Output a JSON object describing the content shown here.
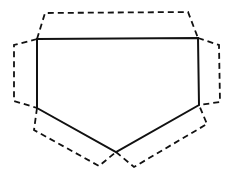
{
  "diagram": {
    "colors": {
      "background": "#ffffff",
      "stroke": "#111111"
    },
    "base_shape": {
      "name": "pentagon",
      "line_style": "solid",
      "sides": 5
    },
    "flaps": [
      {
        "id": "top",
        "line_style": "dashed",
        "attached_side": "top"
      },
      {
        "id": "left",
        "line_style": "dashed",
        "attached_side": "left"
      },
      {
        "id": "right",
        "line_style": "dashed",
        "attached_side": "right"
      },
      {
        "id": "lower-left",
        "line_style": "dashed",
        "attached_side": "lower-left"
      },
      {
        "id": "lower-right",
        "line_style": "dashed",
        "attached_side": "lower-right"
      }
    ]
  }
}
